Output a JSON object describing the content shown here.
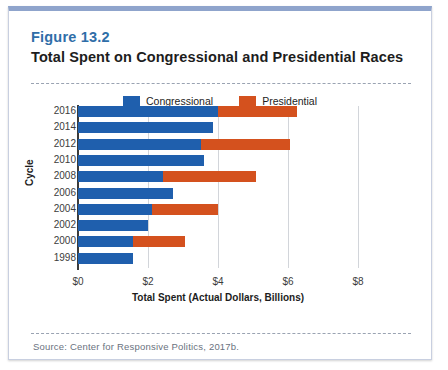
{
  "figure": {
    "number": "Figure 13.2",
    "title": "Total Spent on Congressional and Presidential Races",
    "source": "Source: Center for Responsive Politics, 2017b."
  },
  "legend": {
    "items": [
      {
        "label": "Congressional",
        "color": "#1f5fad",
        "swatch_name": "legend-swatch-congressional"
      },
      {
        "label": "Presidential",
        "color": "#d4511e",
        "swatch_name": "legend-swatch-presidential"
      }
    ]
  },
  "chart_data": {
    "type": "bar",
    "orientation": "horizontal",
    "stacked": true,
    "title": "Total Spent on Congressional and Presidential Races",
    "xlabel": "Total Spent (Actual Dollars, Billions)",
    "ylabel": "Cycle",
    "categories": [
      "2016",
      "2014",
      "2012",
      "2010",
      "2008",
      "2006",
      "2004",
      "2002",
      "2000",
      "1998"
    ],
    "series": [
      {
        "name": "Congressional",
        "color": "#1f5fad",
        "values": [
          4.0,
          3.86,
          3.5,
          3.6,
          2.43,
          2.7,
          2.1,
          2.0,
          1.57,
          1.57
        ]
      },
      {
        "name": "Presidential",
        "color": "#d4511e",
        "values": [
          2.25,
          0.0,
          2.55,
          0.0,
          2.67,
          0.0,
          1.9,
          0.0,
          1.49,
          0.0
        ]
      }
    ],
    "totals": [
      6.25,
      3.86,
      6.05,
      3.6,
      5.1,
      2.7,
      4.0,
      2.0,
      3.06,
      1.57
    ],
    "xlim": [
      0,
      8
    ],
    "xticks": [
      0,
      2,
      4,
      6,
      8
    ],
    "xtick_labels": [
      "$0",
      "$2",
      "$4",
      "$6",
      "$8"
    ],
    "grid": "vertical",
    "legend_position": "top-center"
  }
}
